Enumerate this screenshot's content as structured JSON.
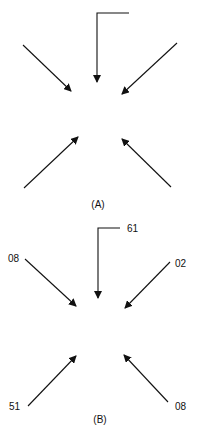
{
  "panels": [
    {
      "label": "(A)",
      "numbers": []
    },
    {
      "label": "(B)",
      "numbers": {
        "top": "61",
        "top_left": "08",
        "top_right": "02",
        "bottom_left": "51",
        "bottom_right": "08"
      }
    }
  ],
  "colors": {
    "stroke": "#111111",
    "background": "#ffffff"
  }
}
